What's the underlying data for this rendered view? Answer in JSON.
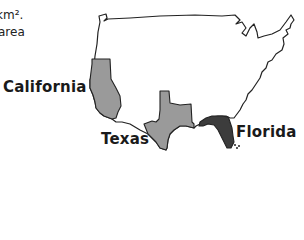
{
  "intro": {
    "line1": "km².",
    "line2": "area"
  },
  "map": {
    "title": "United States outline",
    "states": [
      {
        "name": "California",
        "fill": "#9a9a9a"
      },
      {
        "name": "Texas",
        "fill": "#9a9a9a"
      },
      {
        "name": "Florida",
        "fill": "#3c3c3c"
      }
    ],
    "outline_color": "#222222",
    "background": "#ffffff"
  },
  "labels": {
    "california": "California",
    "texas": "Texas",
    "florida": "Florida"
  }
}
